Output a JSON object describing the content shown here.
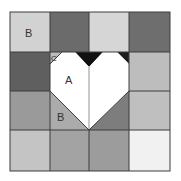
{
  "diagram": {
    "grid": {
      "rows": 4,
      "cols": 4,
      "cells": [
        [
          "#d2d2d2",
          "#6b6b6b",
          "#d6d6d6",
          "#6e6e6e"
        ],
        [
          "#5f5f5f",
          "heart",
          "heart",
          "#bdbdbd"
        ],
        [
          "#9a9a9a",
          "heart",
          "heart",
          "#bfbfbf"
        ],
        [
          "#c4c4c4",
          "#a3a3a3",
          "#9c9c9c",
          "#f1f1f1"
        ]
      ]
    },
    "colors": {
      "heart": "#ffffff",
      "notch": "#111111",
      "corner_dark": "#4a4a4a",
      "region_b_left": "#ababab",
      "region_b_right": "#7d7d7d",
      "region_c": "#bcbcbc",
      "line": "#444444"
    },
    "labels": {
      "top_left": "B",
      "heart": "A",
      "lower_left": "B",
      "corner": "C"
    }
  }
}
